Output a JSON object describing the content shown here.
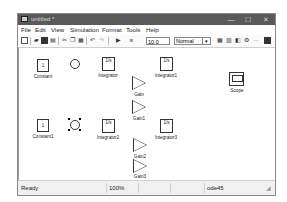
{
  "window": {
    "title": "untitled *",
    "controls": {
      "minimize": "—",
      "maximize": "☐",
      "close": "✕"
    }
  },
  "menubar": {
    "items": [
      "File",
      "Edit",
      "View",
      "Simulation",
      "Format",
      "Tools",
      "Help"
    ]
  },
  "toolbar": {
    "stop_time": "10.0",
    "sim_mode": "Normal",
    "icons": [
      "new-icon",
      "open-icon",
      "save-icon",
      "print-icon",
      "cut-icon",
      "copy-icon",
      "paste-icon",
      "undo-icon",
      "redo-icon",
      "play-icon",
      "stop-icon",
      "library-browser-icon",
      "model-explorer-icon",
      "debugger-icon",
      "build-icon",
      "signal-icon",
      "config-icon"
    ]
  },
  "canvas": {
    "blocks": [
      {
        "name": "Constant",
        "type": "constant",
        "value": "1"
      },
      {
        "name": "Sum",
        "type": "sum"
      },
      {
        "name": "Integrator",
        "type": "integrator",
        "value": "1/s"
      },
      {
        "name": "Integrator1",
        "type": "integrator",
        "value": "1/s"
      },
      {
        "name": "Gain",
        "type": "gain",
        "value": "1"
      },
      {
        "name": "Gain1",
        "type": "gain",
        "value": "1"
      },
      {
        "name": "Scope",
        "type": "scope"
      },
      {
        "name": "Constant1",
        "type": "constant",
        "value": "1"
      },
      {
        "name": "Sum1",
        "type": "sum",
        "selected": true
      },
      {
        "name": "Integrator2",
        "type": "integrator",
        "value": "1/s"
      },
      {
        "name": "Integrator3",
        "type": "integrator",
        "value": "1/s"
      },
      {
        "name": "Gain2",
        "type": "gain",
        "value": "1"
      },
      {
        "name": "Gain3",
        "type": "gain",
        "value": "1"
      }
    ]
  },
  "statusbar": {
    "status": "Ready",
    "zoom": "100%",
    "solver": "ode45"
  }
}
